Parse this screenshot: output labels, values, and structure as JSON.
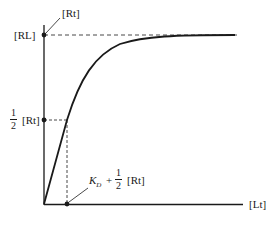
{
  "diagram": {
    "type": "binding-saturation-curve",
    "labels": {
      "rt_top": "[Rt]",
      "rl": "[RL]",
      "half_num": "1",
      "half_den": "2",
      "half_rt": "[Rt]",
      "kd_k": "K",
      "kd_sub": "D",
      "kd_plus": "+",
      "kd_half_num": "1",
      "kd_half_den": "2",
      "kd_rt": "[Rt]",
      "x_axis": "[Lt]"
    },
    "colors": {
      "line": "#1a1a1a",
      "background": "#ffffff"
    }
  }
}
